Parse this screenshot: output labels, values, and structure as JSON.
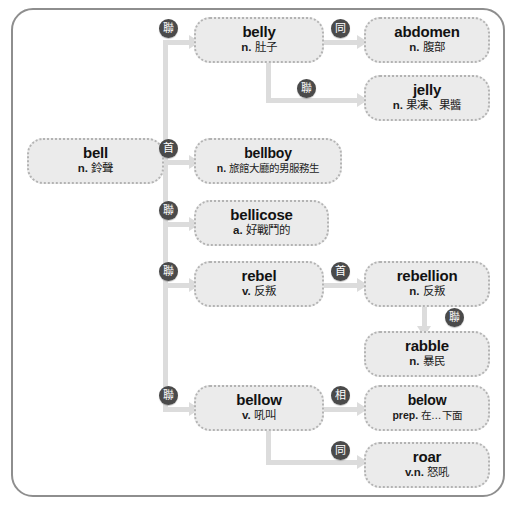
{
  "diagram": {
    "frame_color": "#8e8e8e",
    "node_fill": "#ebebeb",
    "node_border": "#b3b3b3",
    "connector_color": "#dcdcdc",
    "badge_color": "#4a4a4a"
  },
  "nodes": {
    "bell": {
      "word": "bell",
      "pos": "n.",
      "meaning": "鈴聲"
    },
    "belly": {
      "word": "belly",
      "pos": "n.",
      "meaning": "肚子"
    },
    "abdomen": {
      "word": "abdomen",
      "pos": "n.",
      "meaning": "腹部"
    },
    "jelly": {
      "word": "jelly",
      "pos": "n.",
      "meaning": "果凍、果醬"
    },
    "bellboy": {
      "word": "bellboy",
      "pos": "n.",
      "meaning": "旅館大廳的男服務生"
    },
    "bellicose": {
      "word": "bellicose",
      "pos": "a.",
      "meaning": "好戰鬥的"
    },
    "rebel": {
      "word": "rebel",
      "pos": "v.",
      "meaning": "反叛"
    },
    "rebellion": {
      "word": "rebellion",
      "pos": "n.",
      "meaning": "反叛"
    },
    "rabble": {
      "word": "rabble",
      "pos": "n.",
      "meaning": "暴民"
    },
    "bellow": {
      "word": "bellow",
      "pos": "v.",
      "meaning": "吼叫"
    },
    "below": {
      "word": "below",
      "pos": "prep.",
      "meaning": "在…下面"
    },
    "roar": {
      "word": "roar",
      "pos": "v.n.",
      "meaning": "怒吼"
    }
  },
  "badges": {
    "bell_to_belly": "聯",
    "belly_to_abdomen": "同",
    "belly_to_jelly": "聯",
    "bell_to_bellboy": "首",
    "bell_to_bellicose": "聯",
    "bell_to_rebel": "聯",
    "rebel_to_rebellion": "首",
    "rebellion_to_rabble": "聯",
    "bell_to_bellow": "聯",
    "bellow_to_below": "相",
    "bellow_to_roar": "同"
  }
}
